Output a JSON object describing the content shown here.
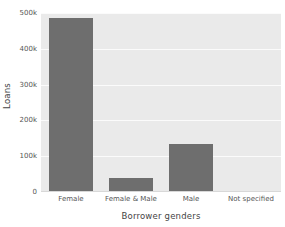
{
  "chart_data": {
    "type": "bar",
    "title": "",
    "xlabel": "Borrower genders",
    "ylabel": "Loans",
    "categories": [
      "Female",
      "Female & Male",
      "Male",
      "Not specified"
    ],
    "values": [
      487000,
      38000,
      133000,
      1000
    ],
    "ylim": [
      0,
      500000
    ],
    "ytick_values": [
      0,
      100000,
      200000,
      300000,
      400000,
      500000
    ],
    "ytick_labels": [
      "0",
      "100k",
      "200k",
      "300k",
      "400k",
      "500k"
    ],
    "grid": true,
    "legend": null,
    "series": [
      {
        "name": "Loans",
        "values": [
          487000,
          38000,
          133000,
          1000
        ]
      }
    ],
    "colors": {
      "bar": "#6e6e6e",
      "plot_background": "#eaeaea",
      "gridline": "#fbfbfb",
      "figure_background": "#ffffff",
      "tick_text": "#555555",
      "axis_label_text": "#444444"
    }
  }
}
